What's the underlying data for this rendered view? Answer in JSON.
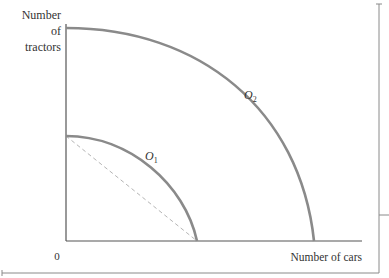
{
  "diagram": {
    "y_axis_label_lines": [
      "Number",
      "of",
      "tractors"
    ],
    "x_axis_label": "Number of cars",
    "origin_label": "0",
    "curves": [
      {
        "name": "O",
        "subscript": "1",
        "description": "inner frontier"
      },
      {
        "name": "O",
        "subscript": "2",
        "description": "outer frontier"
      }
    ],
    "dashed_line": "straight line between inner frontier intercepts",
    "colors": {
      "curve": "#8a8a8a",
      "axis": "#555555",
      "dashed": "#b5b5b5",
      "text": "#333333"
    }
  }
}
